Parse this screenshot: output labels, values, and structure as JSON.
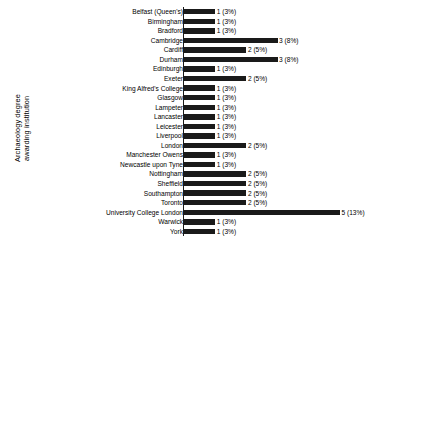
{
  "chart_data": [
    {
      "type": "bar",
      "id": "archaeology-institution",
      "title": "",
      "ylabel": "Archaeology degree\nawarding institution",
      "xlabel": "",
      "orientation": "horizontal",
      "grid": false,
      "legend": "none",
      "xlim": [
        0,
        5
      ],
      "categories": [
        "Belfast (Queen's)",
        "Birmingham",
        "Bradford",
        "Cambridge",
        "Cardiff",
        "Durham",
        "Edinburgh",
        "Exeter",
        "King Alfred's College",
        "Glasgow",
        "Lampeter",
        "Lancaster",
        "Leicester",
        "Liverpool",
        "London",
        "Manchester Owens",
        "Newcastle upon Tyne",
        "Nottingham",
        "Sheffield",
        "Southampton",
        "Toronto",
        "University College London",
        "Warwick",
        "York"
      ],
      "values": [
        1,
        1,
        1,
        3,
        2,
        3,
        1,
        2,
        1,
        1,
        1,
        1,
        1,
        1,
        2,
        1,
        1,
        2,
        2,
        2,
        2,
        5,
        1,
        1
      ],
      "percents": [
        "3%",
        "3%",
        "3%",
        "8%",
        "5%",
        "8%",
        "3%",
        "5%",
        "3%",
        "3%",
        "3%",
        "3%",
        "3%",
        "3%",
        "5%",
        "3%",
        "3%",
        "5%",
        "5%",
        "5%",
        "5%",
        "13%",
        "3%",
        "3%"
      ],
      "labels": [
        "1 (3%)",
        "1 (3%)",
        "1 (3%)",
        "3 (8%)",
        "2 (5%)",
        "3 (8%)",
        "1 (3%)",
        "2 (5%)",
        "1 (3%)",
        "1 (3%)",
        "1 (3%)",
        "1 (3%)",
        "1 (3%)",
        "1 (3%)",
        "2 (5%)",
        "1 (3%)",
        "1 (3%)",
        "2 (5%)",
        "2 (5%)",
        "2 (5%)",
        "2 (5%)",
        "5 (13%)",
        "1 (3%)",
        "1 (3%)"
      ]
    },
    {
      "type": "bar",
      "id": "science-education-level",
      "title": "",
      "ylabel": "Highest level of\nscience education",
      "xlabel": "",
      "orientation": "horizontal",
      "grouped": true,
      "grid": false,
      "legend": "inline-labels",
      "xlim": [
        0,
        25
      ],
      "categories": [
        "Age 11 or under",
        "Age 13",
        "Age 15/16 (e.g. GCSE)",
        "Age 17/18 (e.g. A-level, Highers)",
        "Undergraduate degree",
        "Postgraduate degree"
      ],
      "series": [
        {
          "name": "Female",
          "fill": "#1a1a1a",
          "values": [
            0,
            1,
            25,
            6,
            2,
            0
          ],
          "percents": [
            "0%",
            "3%",
            "74%",
            "18%",
            "6%",
            null
          ]
        },
        {
          "name": "Male",
          "fill": "#ffffff",
          "values": [
            0,
            0,
            12,
            8,
            2,
            5
          ],
          "percents": [
            null,
            null,
            "44%",
            "30%",
            "7%",
            "19%"
          ]
        }
      ],
      "rows": [
        {
          "category": "Age 11 or under",
          "mode": "zero",
          "bars": [],
          "annotations": [
            {
              "series": "",
              "value": "0",
              "percent": "(0%)",
              "bold_value": true,
              "bold_percent": true
            }
          ]
        },
        {
          "category": "Age 13",
          "mode": "single",
          "bars": [
            {
              "series": "Female",
              "value": 1,
              "fill": "filled"
            }
          ],
          "annotations": [
            {
              "series": "Female",
              "value": "",
              "percent": "(3%)",
              "bold_value": false,
              "bold_percent": true
            }
          ]
        },
        {
          "category": "Age 15/16 (e.g. GCSE)",
          "mode": "two-bar",
          "bars": [
            {
              "series": "Female",
              "value": 25,
              "fill": "filled"
            },
            {
              "series": "Male",
              "value": 12,
              "fill": "open"
            }
          ],
          "annotations": [
            {
              "series": "Female",
              "value": "25",
              "percent": "(74%)",
              "bold_value": true,
              "bold_percent": true
            },
            {
              "series": "Male",
              "value": "12",
              "percent": "(44%)",
              "bold_value": true,
              "bold_percent": true
            }
          ]
        },
        {
          "category": "Age 17/18 (e.g. A-level, Highers)",
          "mode": "two-bar",
          "bars": [
            {
              "series": "Female",
              "value": 6,
              "fill": "filled"
            },
            {
              "series": "Male",
              "value": 8,
              "fill": "open"
            }
          ],
          "annotations": [
            {
              "series": "Female",
              "value": "6",
              "percent": "(18%)",
              "bold_value": true,
              "bold_percent": true
            },
            {
              "series": "Male",
              "value": "8",
              "percent": "(30%)",
              "bold_value": true,
              "bold_percent": true
            }
          ]
        },
        {
          "category": "Undergraduate degree",
          "mode": "two-bar",
          "bars": [
            {
              "series": "Female",
              "value": 2,
              "fill": "filled"
            },
            {
              "series": "Male",
              "value": 2,
              "fill": "open"
            }
          ],
          "annotations": [
            {
              "series": "Female",
              "value": "2",
              "percent": "(6%)",
              "bold_value": true,
              "bold_percent": true
            },
            {
              "series": "Male",
              "value": "2",
              "percent": "(7%)",
              "bold_value": true,
              "bold_percent": true
            }
          ]
        },
        {
          "category": "Postgraduate degree",
          "mode": "single-open",
          "bars": [
            {
              "series": "Male",
              "value": 5,
              "fill": "open"
            }
          ],
          "annotations": [
            {
              "series": "Male",
              "value": "5",
              "percent": "(19%)",
              "bold_value": true,
              "bold_percent": true
            }
          ]
        }
      ]
    }
  ],
  "institution_chart": {
    "axis_title": "Archaeology degree\nawarding institution"
  },
  "science_chart": {
    "axis_title": "Highest level of\nscience education"
  }
}
